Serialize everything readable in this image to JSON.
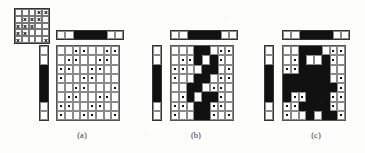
{
  "figure": {
    "type": "raster-pattern-diagram",
    "background_color": "#fdfdfc",
    "ink_color": "#111111",
    "grid_line_color": "#8a8a8a",
    "caption_a": "(a)",
    "caption_b": "(b)",
    "caption_c": "(c)"
  },
  "key_grid": {
    "name": "x-mark-template-grid",
    "rows": 5,
    "cols": 5,
    "marks": [
      [
        0,
        0,
        0,
        1,
        1
      ],
      [
        0,
        1,
        1,
        1,
        0
      ],
      [
        1,
        1,
        1,
        0,
        0
      ],
      [
        1,
        1,
        0,
        0,
        0
      ],
      [
        1,
        0,
        0,
        0,
        1
      ]
    ]
  },
  "panels": [
    {
      "id": "a",
      "caption": "(a)",
      "hbar": [
        0,
        0,
        1,
        1,
        1,
        1,
        0,
        0
      ],
      "vbar": [
        0,
        0,
        1,
        1,
        1,
        1,
        0,
        0
      ],
      "grid": {
        "rows": 8,
        "cols": 8,
        "fill": [
          [
            0,
            0,
            0,
            0,
            0,
            0,
            0,
            0
          ],
          [
            0,
            0,
            0,
            0,
            0,
            0,
            0,
            0
          ],
          [
            0,
            0,
            0,
            0,
            0,
            0,
            0,
            0
          ],
          [
            0,
            0,
            0,
            0,
            0,
            0,
            0,
            0
          ],
          [
            0,
            0,
            0,
            0,
            0,
            0,
            0,
            0
          ],
          [
            0,
            0,
            0,
            0,
            0,
            0,
            0,
            0
          ],
          [
            0,
            0,
            0,
            0,
            0,
            0,
            0,
            0
          ],
          [
            0,
            0,
            0,
            0,
            0,
            0,
            0,
            0
          ]
        ],
        "dots": [
          [
            0,
            0,
            1,
            1,
            0,
            0,
            1,
            1
          ],
          [
            0,
            1,
            1,
            0,
            0,
            1,
            1,
            0
          ],
          [
            1,
            1,
            0,
            0,
            1,
            1,
            0,
            0
          ],
          [
            1,
            0,
            0,
            1,
            1,
            0,
            0,
            0
          ],
          [
            0,
            0,
            1,
            1,
            0,
            0,
            0,
            1
          ],
          [
            0,
            1,
            1,
            0,
            0,
            1,
            1,
            0
          ],
          [
            1,
            1,
            0,
            0,
            1,
            1,
            0,
            0
          ],
          [
            1,
            0,
            0,
            1,
            1,
            0,
            0,
            1
          ]
        ]
      }
    },
    {
      "id": "b",
      "caption": "(b)",
      "hbar": [
        0,
        0,
        1,
        1,
        1,
        1,
        0,
        0
      ],
      "vbar": [
        0,
        0,
        1,
        1,
        1,
        1,
        0,
        0
      ],
      "grid": {
        "rows": 8,
        "cols": 8,
        "fill": [
          [
            0,
            0,
            0,
            1,
            1,
            0,
            0,
            0
          ],
          [
            0,
            0,
            0,
            1,
            0,
            1,
            0,
            0
          ],
          [
            0,
            0,
            0,
            0,
            1,
            1,
            0,
            0
          ],
          [
            0,
            0,
            0,
            1,
            1,
            0,
            0,
            0
          ],
          [
            0,
            0,
            1,
            1,
            0,
            0,
            0,
            0
          ],
          [
            0,
            0,
            1,
            0,
            1,
            1,
            0,
            0
          ],
          [
            0,
            0,
            0,
            1,
            1,
            0,
            0,
            0
          ],
          [
            0,
            0,
            0,
            1,
            1,
            0,
            0,
            0
          ]
        ],
        "dots": [
          [
            0,
            0,
            0,
            0,
            0,
            0,
            1,
            1
          ],
          [
            0,
            1,
            1,
            0,
            0,
            0,
            1,
            0
          ],
          [
            1,
            1,
            0,
            0,
            0,
            0,
            0,
            1
          ],
          [
            1,
            0,
            0,
            0,
            0,
            0,
            1,
            1
          ],
          [
            0,
            0,
            0,
            0,
            0,
            1,
            1,
            0
          ],
          [
            0,
            1,
            0,
            0,
            0,
            0,
            1,
            0
          ],
          [
            1,
            1,
            0,
            0,
            0,
            1,
            1,
            0
          ],
          [
            1,
            0,
            0,
            0,
            0,
            1,
            0,
            1
          ]
        ]
      }
    },
    {
      "id": "c",
      "caption": "(c)",
      "hbar": [
        0,
        0,
        1,
        1,
        1,
        1,
        0,
        0
      ],
      "vbar": [
        0,
        0,
        1,
        1,
        1,
        1,
        0,
        0
      ],
      "grid": {
        "rows": 8,
        "cols": 8,
        "fill": [
          [
            0,
            0,
            1,
            1,
            1,
            0,
            0,
            0
          ],
          [
            0,
            0,
            1,
            0,
            0,
            1,
            0,
            0
          ],
          [
            0,
            0,
            1,
            1,
            1,
            1,
            0,
            0
          ],
          [
            1,
            1,
            1,
            1,
            1,
            1,
            0,
            0
          ],
          [
            1,
            1,
            1,
            1,
            1,
            1,
            1,
            0
          ],
          [
            1,
            0,
            0,
            1,
            1,
            1,
            0,
            0
          ],
          [
            0,
            0,
            1,
            1,
            1,
            1,
            0,
            0
          ],
          [
            0,
            0,
            0,
            1,
            0,
            1,
            1,
            0
          ]
        ],
        "dots": [
          [
            0,
            0,
            0,
            0,
            0,
            0,
            1,
            1
          ],
          [
            0,
            1,
            0,
            0,
            0,
            0,
            1,
            0
          ],
          [
            1,
            1,
            0,
            0,
            0,
            0,
            0,
            0
          ],
          [
            0,
            0,
            0,
            0,
            0,
            0,
            0,
            1
          ],
          [
            0,
            0,
            0,
            0,
            0,
            0,
            0,
            1
          ],
          [
            0,
            1,
            1,
            0,
            0,
            0,
            1,
            1
          ],
          [
            1,
            1,
            0,
            0,
            0,
            0,
            1,
            0
          ],
          [
            1,
            0,
            0,
            0,
            0,
            0,
            0,
            1
          ]
        ]
      }
    }
  ]
}
